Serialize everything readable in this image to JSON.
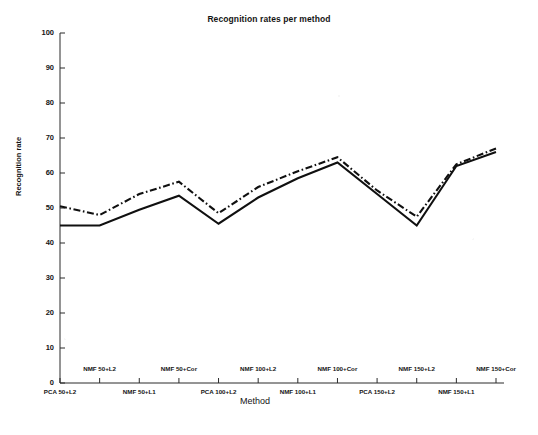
{
  "chart_data": {
    "type": "line",
    "title": "Recognition rates per method",
    "xlabel": "Method",
    "ylabel": "Recognition rate",
    "ylim": [
      0,
      100
    ],
    "ytick_values": [
      0,
      10,
      20,
      30,
      40,
      50,
      60,
      70,
      80,
      90,
      100
    ],
    "ytick_labels": [
      "0",
      "10",
      "20",
      "30",
      "40",
      "50",
      "60",
      "70",
      "80",
      "90",
      "100"
    ],
    "grid": false,
    "legend": "none",
    "categories": [
      "PCA 50+L2",
      "NMF 50+L2",
      "NMF 50+L1",
      "NMF 50+Cor",
      "PCA 100+L2",
      "NMF 100+L2",
      "NMF 100+L1",
      "NMF 100+Cor",
      "PCA 150+L2",
      "NMF 150+L2",
      "NMF 150+L1",
      "NMF 150+Cor"
    ],
    "series": [
      {
        "name": "solid",
        "style": "solid",
        "color": "#101010",
        "values": [
          45,
          45,
          49.5,
          53.5,
          45.5,
          53,
          58.5,
          63,
          54,
          45,
          62,
          66
        ]
      },
      {
        "name": "dash-dot",
        "style": "dashdot",
        "color": "#101010",
        "values": [
          50.5,
          48,
          54,
          57.5,
          48.5,
          56,
          60.5,
          64.5,
          55,
          47.5,
          62.5,
          67
        ]
      }
    ]
  }
}
